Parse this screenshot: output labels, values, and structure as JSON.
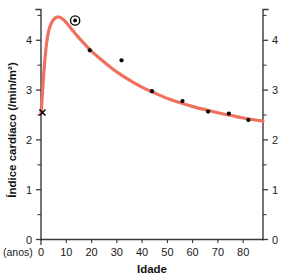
{
  "chart_data": {
    "type": "line",
    "title": "",
    "xlabel": "Idade",
    "ylabel": "Índice cardíaco (/min/m²)",
    "x_unit_note": "(anos)",
    "xlim": [
      0,
      91
    ],
    "ylim": [
      0,
      4.62
    ],
    "grid": false,
    "legend": null,
    "x_ticks_major": [
      0,
      10,
      20,
      30,
      40,
      50,
      60,
      70,
      80
    ],
    "x_tick_labels": [
      "0",
      "10",
      "20",
      "30",
      "40",
      "50",
      "60",
      "70",
      "80"
    ],
    "y_ticks_major": [
      0,
      1,
      2,
      3,
      4
    ],
    "y_tick_labels": [
      "0",
      "1",
      "2",
      "3",
      "4"
    ],
    "y_ticks_minor": [
      0.5,
      1.5,
      2.5,
      3.5,
      4.5
    ],
    "right_axis_present": true,
    "right_y_tick_labels": [
      "0",
      "1",
      "2",
      "3",
      "4"
    ],
    "curve_color": "#F0705E",
    "marker_color": "#000000",
    "series": [
      {
        "name": "Curva ajustada (índice cardíaco)",
        "type": "line",
        "color": "#F0705E",
        "x": [
          0,
          0.6,
          1.2,
          1.8,
          2.4,
          3.2,
          4.2,
          5.2,
          6.2,
          7.2,
          8.2,
          9.5,
          11,
          13,
          15,
          18,
          21,
          25,
          29,
          33,
          38,
          43,
          48,
          53,
          58,
          63,
          68,
          73,
          78,
          83,
          88,
          91
        ],
        "y": [
          2.52,
          2.95,
          3.38,
          3.72,
          3.98,
          4.2,
          4.34,
          4.42,
          4.46,
          4.47,
          4.45,
          4.4,
          4.32,
          4.2,
          4.08,
          3.92,
          3.77,
          3.6,
          3.44,
          3.3,
          3.15,
          3.02,
          2.91,
          2.81,
          2.73,
          2.66,
          2.6,
          2.54,
          2.49,
          2.44,
          2.4,
          2.38
        ]
      },
      {
        "name": "Pontos observados",
        "type": "scatter",
        "color": "#000000",
        "points": [
          {
            "x": 20,
            "y": 3.8
          },
          {
            "x": 33,
            "y": 3.6
          },
          {
            "x": 45.5,
            "y": 2.98
          },
          {
            "x": 58,
            "y": 2.78
          },
          {
            "x": 68.5,
            "y": 2.57
          },
          {
            "x": 77,
            "y": 2.53
          },
          {
            "x": 85,
            "y": 2.4
          }
        ]
      },
      {
        "name": "Ponto destacado",
        "type": "scatter",
        "marker": "circled-dot",
        "color": "#000000",
        "points": [
          {
            "x": 14,
            "y": 4.4
          }
        ]
      },
      {
        "name": "Ponto inicial",
        "type": "scatter",
        "marker": "cross",
        "color": "#000000",
        "points": [
          {
            "x": 0.6,
            "y": 2.55
          }
        ]
      }
    ]
  },
  "axes": {
    "x_title": "Idade",
    "x_unit": "(anos)",
    "y_title": "Índice cardíaco (/min/m²)"
  }
}
